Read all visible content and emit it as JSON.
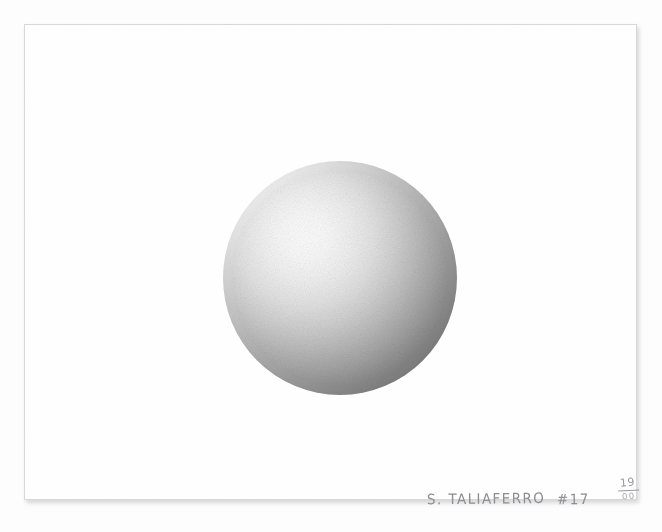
{
  "artwork": {
    "medium_subject": "graphite sphere study",
    "background_color": "#fdfdfd",
    "paper_color": "#ffffff",
    "paper_border_color": "#d8d8d8",
    "sphere": {
      "highlight_color": "#fcfcfc",
      "midtone_color": "#bbbbbb",
      "shadow_color": "#484848",
      "light_source": "upper-left",
      "center_x": 315,
      "center_y": 253,
      "diameter": 234
    },
    "inscription": {
      "signature": "S. TALIAFERRO",
      "plate_number": "#17",
      "edition_numerator": "19",
      "edition_denominator": "00",
      "ink_color": "#8d8d92"
    }
  }
}
